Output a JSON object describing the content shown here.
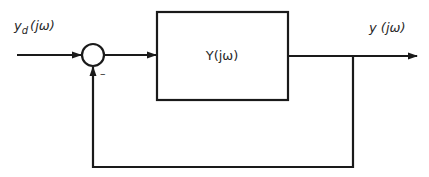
{
  "diagram": {
    "type": "feedback-block-diagram",
    "input_label": {
      "main": "y",
      "sub": "d",
      "arg": "(jω)"
    },
    "output_label": {
      "main": "y",
      "arg": " (jω)"
    },
    "block_label": "Y(jω)",
    "summing_junction": {
      "feedback_sign": "–"
    },
    "colors": {
      "stroke": "#1a1a1a",
      "text": "#2a2a2a",
      "background": "#ffffff"
    }
  }
}
